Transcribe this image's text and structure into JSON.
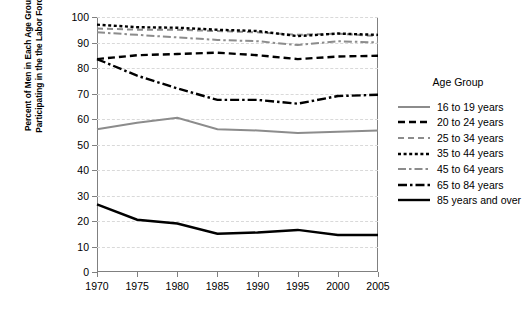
{
  "chart_data": {
    "type": "line",
    "title": "",
    "xlabel": "",
    "ylabel": "Percent of Men in Each Age Group Participating in the the Labor Force",
    "ylabel_line1": "Percent of Men in Each Age Group",
    "ylabel_line2": "Participating in the the Labor Force",
    "x": [
      1970,
      1975,
      1980,
      1985,
      1990,
      1995,
      2000,
      2005
    ],
    "xlim": [
      1970,
      2005
    ],
    "ylim": [
      0,
      100
    ],
    "yticks": [
      0,
      10,
      20,
      30,
      40,
      50,
      60,
      70,
      80,
      90,
      100
    ],
    "xticks": [
      1970,
      1975,
      1980,
      1985,
      1990,
      1995,
      2000,
      2005
    ],
    "grid": true,
    "grid_axis": "y",
    "legend_position": "right",
    "legend_title": "Age Group",
    "series": [
      {
        "name": "16 to 19 years",
        "values": [
          56.0,
          58.5,
          60.5,
          56.0,
          55.5,
          54.5,
          55.0,
          55.5
        ],
        "color": "#8c8c8c",
        "style": "solid",
        "dasharray": "",
        "width": 2.0
      },
      {
        "name": "20 to 24 years",
        "values": [
          83.5,
          85.0,
          85.5,
          86.0,
          85.0,
          83.5,
          84.5,
          84.8
        ],
        "color": "#000000",
        "style": "dashed",
        "dasharray": "7,4",
        "width": 2.4
      },
      {
        "name": "25 to 34 years",
        "values": [
          95.5,
          95.0,
          95.0,
          94.5,
          94.0,
          93.0,
          93.5,
          92.5
        ],
        "color": "#8c8c8c",
        "style": "dashed",
        "dasharray": "6,4",
        "width": 2.0
      },
      {
        "name": "35 to 44 years",
        "values": [
          97.0,
          96.0,
          95.8,
          95.0,
          94.5,
          92.5,
          93.5,
          93.0
        ],
        "color": "#000000",
        "style": "dotted",
        "dasharray": "3,2.6",
        "width": 2.4
      },
      {
        "name": "45 to 64 years",
        "values": [
          94.0,
          93.0,
          92.0,
          91.0,
          90.5,
          89.0,
          90.5,
          90.0
        ],
        "color": "#8c8c8c",
        "style": "dashdot",
        "dasharray": "8,3,2.5,3",
        "width": 2.0
      },
      {
        "name": "65 to 84 years",
        "values": [
          83.5,
          77.0,
          72.0,
          67.5,
          67.5,
          66.0,
          69.0,
          69.5
        ],
        "color": "#000000",
        "style": "dashdot",
        "dasharray": "9,3,2.5,3",
        "width": 2.4
      },
      {
        "name": "85 years and over",
        "values": [
          26.5,
          20.5,
          19.0,
          15.0,
          15.5,
          16.5,
          14.5,
          14.5
        ],
        "color": "#000000",
        "style": "solid",
        "dasharray": "",
        "width": 2.4
      }
    ]
  }
}
